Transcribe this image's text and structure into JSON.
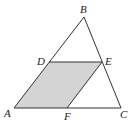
{
  "diagram": {
    "type": "geometry",
    "colors": {
      "stroke": "#333333",
      "shade": "#d4d4d4",
      "background": "#ffffff"
    },
    "points": {
      "A": {
        "label": "A",
        "x": 14,
        "y": 108
      },
      "B": {
        "label": "B",
        "x": 84,
        "y": 17
      },
      "C": {
        "label": "C",
        "x": 121,
        "y": 108
      },
      "D": {
        "label": "D",
        "x": 49,
        "y": 62
      },
      "E": {
        "label": "E",
        "x": 102,
        "y": 62
      },
      "F": {
        "label": "F",
        "x": 67,
        "y": 108
      }
    },
    "segments": [
      "AB",
      "BC",
      "CA",
      "DE",
      "EF"
    ],
    "shaded_region": [
      "A",
      "D",
      "E",
      "F"
    ]
  }
}
